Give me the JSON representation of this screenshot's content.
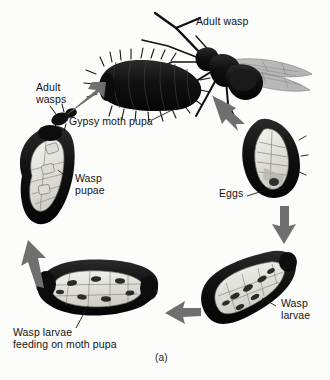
{
  "figure": {
    "caption": "(a)",
    "background_color": "#fcfcfb",
    "ink_color": "#111111",
    "arrow_color": "#6f6f6f",
    "body_dark": "#141414",
    "interior_light": "#efefea",
    "interior_mid": "#b8b8b0",
    "wing_gray": "#9a9a9a"
  },
  "labels": [
    {
      "id": "adult-wasp",
      "text": "Adult wasp",
      "x": 196,
      "y": 22
    },
    {
      "id": "adult-wasps",
      "text": "Adult\nwasps",
      "x": 36,
      "y": 88
    },
    {
      "id": "gypsy-moth-pupa",
      "text": "Gypsy moth pupa",
      "x": 69,
      "y": 122
    },
    {
      "id": "wasp-pupae",
      "text": "Wasp\npupae",
      "x": 75,
      "y": 178
    },
    {
      "id": "eggs",
      "text": "Eggs",
      "x": 219,
      "y": 192
    },
    {
      "id": "wasp-larvae",
      "text": "Wasp\nlarvae",
      "x": 281,
      "y": 302
    },
    {
      "id": "wasp-larvae-feeding",
      "text": "Wasp larvae\nfeeding on moth pupa",
      "x": 13,
      "y": 331
    }
  ],
  "stages": [
    {
      "id": "adult-wasp-stage",
      "name": "Adult wasp on gypsy moth pupa"
    },
    {
      "id": "eggs-stage",
      "name": "Eggs inside moth pupa"
    },
    {
      "id": "wasp-larvae-stage",
      "name": "Wasp larvae inside moth pupa"
    },
    {
      "id": "larvae-feeding-stage",
      "name": "Wasp larvae feeding on moth pupa"
    },
    {
      "id": "wasp-pupae-stage",
      "name": "Wasp pupae inside moth pupa"
    },
    {
      "id": "adult-wasps-emerging",
      "name": "Adult wasps emerging"
    }
  ],
  "arrows": [
    {
      "id": "arrow-to-eggs",
      "direction": "down-right"
    },
    {
      "id": "arrow-eggs-to-larvae",
      "direction": "down"
    },
    {
      "id": "arrow-larvae-to-feeding",
      "direction": "left"
    },
    {
      "id": "arrow-feeding-to-pupae",
      "direction": "up"
    },
    {
      "id": "arrow-wasps-to-moth",
      "direction": "up-right"
    }
  ]
}
